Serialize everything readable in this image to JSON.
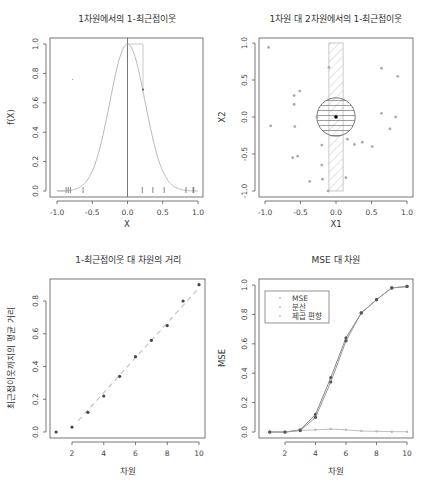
{
  "chart_data": [
    {
      "type": "line",
      "title": "1차원에서의 1-최근접이웃",
      "xlabel": "X",
      "ylabel": "f(X)",
      "xlim": [
        -1.0,
        1.0
      ],
      "ylim": [
        0.0,
        1.0
      ],
      "x_ticks": [
        "-1.0",
        "-0.5",
        "0.0",
        "0.5",
        "1.0"
      ],
      "y_ticks": [
        "0.0",
        "0.2",
        "0.4",
        "0.6",
        "0.8",
        "1.0"
      ],
      "curve": "f(X) = exp(-8 X^2)",
      "vertical_line_x": 0.0,
      "nearest_neighbor_box": {
        "x0": 0.0,
        "x1": 0.22,
        "y_top": 1.0
      },
      "nearest_neighbor_point": {
        "x": 0.22,
        "y": 0.69
      },
      "rug_x": [
        -0.87,
        -0.84,
        -0.81,
        -0.63,
        0.21,
        0.36,
        0.52,
        0.83,
        0.93,
        0.94
      ],
      "stray_point": {
        "x": -0.78,
        "y": 0.76
      },
      "grid": false
    },
    {
      "type": "scatter",
      "title": "1차원 대 2차원에서의 1-최근접이웃",
      "xlabel": "X1",
      "ylabel": "X2",
      "xlim": [
        -1.0,
        1.0
      ],
      "ylim": [
        -1.0,
        1.0
      ],
      "x_ticks": [
        "-1.0",
        "-0.5",
        "0.0",
        "0.5",
        "1.0"
      ],
      "y_ticks": [
        "-1.0",
        "-0.5",
        "0.0",
        "0.5",
        "1.0"
      ],
      "target_point": {
        "x": 0.0,
        "y": 0.0
      },
      "circle_radius": 0.27,
      "hatched_strip": {
        "x0": -0.1,
        "x1": 0.1,
        "y0": -1.0,
        "y1": 1.0
      },
      "points": [
        {
          "x": -0.95,
          "y": 0.94
        },
        {
          "x": -0.1,
          "y": 0.67
        },
        {
          "x": 0.64,
          "y": 0.66
        },
        {
          "x": 0.87,
          "y": 0.55
        },
        {
          "x": -0.51,
          "y": 0.35
        },
        {
          "x": -0.59,
          "y": 0.29
        },
        {
          "x": -0.59,
          "y": 0.17
        },
        {
          "x": -0.27,
          "y": 0.0
        },
        {
          "x": 0.64,
          "y": 0.05
        },
        {
          "x": 0.84,
          "y": 0.0
        },
        {
          "x": -0.92,
          "y": -0.12
        },
        {
          "x": -0.58,
          "y": -0.13
        },
        {
          "x": 0.76,
          "y": -0.16
        },
        {
          "x": 0.16,
          "y": -0.3
        },
        {
          "x": -0.2,
          "y": -0.38
        },
        {
          "x": 0.26,
          "y": -0.37
        },
        {
          "x": 0.37,
          "y": -0.34
        },
        {
          "x": 0.51,
          "y": -0.4
        },
        {
          "x": -0.61,
          "y": -0.55
        },
        {
          "x": -0.54,
          "y": -0.53
        },
        {
          "x": -0.2,
          "y": -0.65
        },
        {
          "x": -0.19,
          "y": -0.84
        },
        {
          "x": 0.14,
          "y": -0.82
        },
        {
          "x": -0.37,
          "y": -0.87
        },
        {
          "x": -0.11,
          "y": -1.0
        }
      ],
      "grid": false
    },
    {
      "type": "scatter",
      "title": "1-최근접이웃 대 차원의 거리",
      "xlabel": "차원",
      "ylabel": "최근접이웃까지의 평균 거리",
      "xlim": [
        1,
        10
      ],
      "ylim": [
        0.0,
        0.9
      ],
      "x_ticks": [
        "2",
        "4",
        "6",
        "8",
        "10"
      ],
      "y_ticks": [
        "0.0",
        "0.2",
        "0.4",
        "0.6",
        "0.8"
      ],
      "x": [
        1,
        2,
        3,
        4,
        5,
        6,
        7,
        8,
        9,
        10
      ],
      "values": [
        0.0,
        0.03,
        0.12,
        0.22,
        0.34,
        0.46,
        0.56,
        0.65,
        0.8,
        0.9
      ],
      "trend_line": {
        "style": "dashed",
        "from": [
          2.4,
          0.07
        ],
        "to": [
          10,
          0.88
        ]
      },
      "grid": false
    },
    {
      "type": "line",
      "title": "MSE 대 차원",
      "xlabel": "차원",
      "ylabel": "MSE",
      "xlim": [
        1,
        10
      ],
      "ylim": [
        0.0,
        1.0
      ],
      "x_ticks": [
        "2",
        "4",
        "6",
        "8",
        "10"
      ],
      "y_ticks": [
        "0.0",
        "0.2",
        "0.4",
        "0.6",
        "0.8",
        "1.0"
      ],
      "categories": [
        1,
        2,
        3,
        4,
        5,
        6,
        7,
        8,
        9,
        10
      ],
      "series": [
        {
          "name": "MSE",
          "values": [
            0.0,
            0.0,
            0.015,
            0.12,
            0.37,
            0.64,
            0.81,
            0.9,
            0.98,
            0.99
          ]
        },
        {
          "name": "분산",
          "values": [
            0.0,
            0.0,
            0.01,
            0.015,
            0.02,
            0.015,
            0.007,
            0.005,
            0.002,
            0.002
          ]
        },
        {
          "name": "제곱 편향",
          "values": [
            0.0,
            0.0,
            0.01,
            0.1,
            0.34,
            0.62,
            0.81,
            0.9,
            0.98,
            0.99
          ]
        }
      ],
      "legend": {
        "position": "top-left",
        "entries": [
          "MSE",
          "분산",
          "제곱 편향"
        ]
      },
      "grid": false
    }
  ]
}
